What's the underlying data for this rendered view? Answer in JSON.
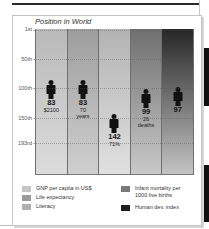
{
  "chart_data": {
    "type": "bar",
    "title": "Position in World",
    "ylabel": "Position in World (rank)",
    "xlabel": "",
    "y_axis": {
      "inverted": true,
      "ticks": [
        "1st",
        "50th",
        "100th",
        "150th",
        "193rd"
      ],
      "tick_values": [
        1,
        50,
        100,
        150,
        193
      ],
      "range": [
        1,
        193
      ]
    },
    "grid": true,
    "legend_position": "bottom",
    "categories": [
      "GNP per capita in US$",
      "Life expectancy",
      "Literacy",
      "Infant mortality per 1000 live births",
      "Human dev. index"
    ],
    "series": [
      {
        "name": "World rank",
        "values": [
          83,
          83,
          142,
          99,
          97
        ]
      }
    ],
    "annotations": [
      {
        "category": "GNP per capita in US$",
        "rank": "83",
        "value": "$2100"
      },
      {
        "category": "Life expectancy",
        "rank": "83",
        "value": "70 years"
      },
      {
        "category": "Literacy",
        "rank": "142",
        "value": "71%"
      },
      {
        "category": "Infant mortality per 1000 live births",
        "rank": "99",
        "value": "26 deaths"
      },
      {
        "category": "Human dev. index",
        "rank": "97",
        "value": ""
      }
    ]
  },
  "chart": {
    "title": "Position in World",
    "y_ticks": [
      {
        "label": "1st",
        "top": 29
      },
      {
        "label": "50th",
        "top": 59
      },
      {
        "label": "100th",
        "top": 88
      },
      {
        "label": "150th",
        "top": 118
      },
      {
        "label": "193rd",
        "top": 143
      }
    ],
    "columns": [
      {
        "rank": "83",
        "line1": "$2100",
        "line2": "",
        "figure_top": 51,
        "color_top": "#b9b9b9",
        "color_bottom": "#dcdcdc"
      },
      {
        "rank": "83",
        "line1": "70",
        "line2": "years",
        "figure_top": 51,
        "color_top": "#9e9e9e",
        "color_bottom": "#cfcfcf"
      },
      {
        "rank": "142",
        "line1": "71%",
        "line2": "",
        "figure_top": 85,
        "color_top": "#b3b3b3",
        "color_bottom": "#e0e0e0"
      },
      {
        "rank": "99",
        "line1": "26",
        "line2": "deaths",
        "figure_top": 60,
        "color_top": "#6f6f6f",
        "color_bottom": "#c9c9c9"
      },
      {
        "rank": "97",
        "line1": "",
        "line2": "",
        "figure_top": 58,
        "color_top": "#262626",
        "color_bottom": "#c4c4c4"
      }
    ]
  },
  "legend": [
    {
      "label": "GNP per capita in US$",
      "color": "#c4c4c4"
    },
    {
      "label": "Life expectancy",
      "color": "#9a9a9a"
    },
    {
      "label": "Literacy",
      "color": "#b0b0b0"
    },
    {
      "label": "Infant mortality per 1000 live births",
      "color": "#7a7a7a"
    },
    {
      "label": "Human dev. index",
      "color": "#1e1e1e"
    }
  ]
}
